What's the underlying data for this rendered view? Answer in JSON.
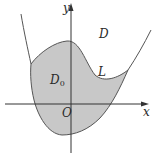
{
  "figure": {
    "axes": {
      "x_label": "x",
      "y_label": "y",
      "origin_label": "O"
    },
    "regions": {
      "outer_label": "D",
      "inner_label_main": "D",
      "inner_label_sub": "0"
    },
    "curve_label": "L",
    "colors": {
      "fill": "#c8c8c8",
      "stroke": "#555555",
      "axis": "#333333",
      "background": "#ffffff"
    }
  }
}
